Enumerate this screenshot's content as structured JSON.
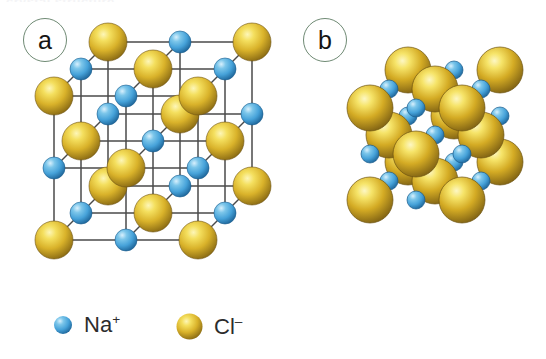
{
  "figure": {
    "top_cut_text": "crystal structure",
    "background": "#ffffff",
    "panels": [
      {
        "id": "a",
        "label": "a",
        "caption": "ball-and-stick rock-salt lattice"
      },
      {
        "id": "b",
        "label": "b",
        "caption": "space-filling packed model"
      }
    ]
  },
  "legend": {
    "items": [
      {
        "key": "na",
        "label": "Na",
        "charge": "+",
        "color": "#4aa6dc",
        "highlight": "#bfe4f7",
        "shadow": "#1f6ea8",
        "radius_px": 9
      },
      {
        "key": "cl",
        "label": "Cl",
        "charge": "–",
        "color": "#d3aa23",
        "highlight": "#f8e885",
        "shadow": "#8a6a12",
        "radius_px": 13
      }
    ]
  },
  "colors": {
    "na_base": "#4aa6dc",
    "na_highlight": "#bfe4f7",
    "na_shadow": "#1c6397",
    "cl_base": "#d3aa23",
    "cl_highlight": "#f9ec8c",
    "cl_shadow": "#8a6a12",
    "bond": "#4a4a4a",
    "badge_ring": "#6f8a74",
    "text": "#1a1a1a"
  },
  "chart_data": {
    "type": "scatter",
    "xlabel": "",
    "ylabel": "",
    "panel_a": {
      "model": "ball-and-stick",
      "lattice": "face-centred cubic rock-salt",
      "grid_dimensions": [
        3,
        3,
        3
      ],
      "ion_count_na": 14,
      "ion_count_cl": 13,
      "na_radius_px": 11,
      "cl_radius_px": 19,
      "projection": "oblique 3D, depth offset up-right"
    },
    "panel_b": {
      "model": "space-filling",
      "lattice": "face-centred cubic rock-salt",
      "grid_dimensions": [
        3,
        3,
        3
      ],
      "na_radius_px": 9,
      "cl_radius_px": 23,
      "projection": "oblique 3D, depth offset up-right"
    }
  }
}
